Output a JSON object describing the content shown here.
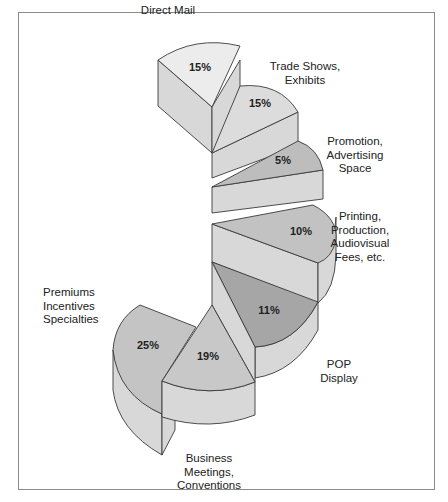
{
  "chart_data": {
    "type": "pie",
    "style": "3d-spiral-staircase",
    "title": "",
    "slices": [
      {
        "label": "Direct Mail",
        "value": 15,
        "value_label": "15%",
        "color": "#ececec"
      },
      {
        "label": "Trade Shows, Exhibits",
        "value": 15,
        "value_label": "15%",
        "color": "#dcdcdc"
      },
      {
        "label": "Promotion, Advertising Space",
        "value": 5,
        "value_label": "5%",
        "color": "#bdbdbd"
      },
      {
        "label": "Printing, Production, Audiovisual Fees, etc.",
        "value": 10,
        "value_label": "10%",
        "color": "#c2c2c2"
      },
      {
        "label": "POP Display",
        "value": 11,
        "value_label": "11%",
        "color": "#a6a6a6"
      },
      {
        "label": "Business Meetings, Conventions",
        "value": 19,
        "value_label": "19%",
        "color": "#c8c8c8"
      },
      {
        "label": "Premiums Incentives Specialties",
        "value": 25,
        "value_label": "25%",
        "color": "#c4c4c4"
      }
    ],
    "label_lines": [
      [
        "Direct Mail"
      ],
      [
        "Trade Shows,",
        "Exhibits"
      ],
      [
        "Promotion,",
        "Advertising",
        "Space"
      ],
      [
        "Printing,",
        "Production,",
        "Audiovisual",
        "Fees, etc."
      ],
      [
        "POP",
        "Display"
      ],
      [
        "Business",
        "Meetings,",
        "Conventions"
      ],
      [
        "Premiums",
        "Incentives",
        "Specialties"
      ]
    ],
    "side_color": "#d8d8d8",
    "legend": "none"
  }
}
